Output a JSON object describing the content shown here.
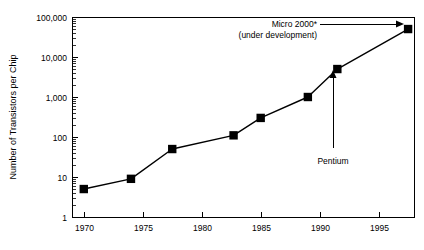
{
  "chart_data": {
    "type": "line",
    "title": "",
    "xlabel": "",
    "ylabel": "Number of Transistors per Chip",
    "xlim": [
      1969.0,
      1998.0
    ],
    "ylim": [
      1,
      100000
    ],
    "yscale": "log",
    "grid": false,
    "legend": "none",
    "xticks": [
      "1970",
      "1975",
      "1980",
      "1985",
      "1990",
      "1995"
    ],
    "xtick_values": [
      1970,
      1975,
      1980,
      1985,
      1990,
      1995
    ],
    "yticks": [
      "1",
      "10",
      "100",
      "1,000",
      "10,000",
      "100,000"
    ],
    "ytick_values": [
      1,
      10,
      100,
      1000,
      10000,
      100000
    ],
    "minor_ticks": true,
    "marker": "square",
    "marker_color": "#000000",
    "line_color": "#000000",
    "x": [
      1970,
      1974,
      1977.5,
      1982.7,
      1985,
      1989,
      1991.5,
      1997.5
    ],
    "values": [
      5,
      9,
      50,
      110,
      300,
      1000,
      5000,
      50000
    ],
    "series": [
      {
        "name": "Transistors per chip",
        "x": [
          1970,
          1974,
          1977.5,
          1982.7,
          1985,
          1989,
          1991.5,
          1997.5
        ],
        "values": [
          5,
          9,
          50,
          110,
          300,
          1000,
          5000,
          50000
        ]
      }
    ],
    "annotations": [
      {
        "name": "micro-2000",
        "lines": [
          "Micro 2000*",
          "(under development)"
        ],
        "points_to_x": 1997.5,
        "points_to_y": 50000,
        "arrow": true
      },
      {
        "name": "pentium",
        "lines": [
          "Pentium"
        ],
        "points_to_x": 1991.5,
        "points_to_y": 5000,
        "arrow": true
      }
    ]
  },
  "axis": {
    "y_title": "Number of Transistors per Chip",
    "y_labels": [
      "100,000",
      "10,000",
      "1,000",
      "100",
      "10",
      "1"
    ],
    "x_labels": [
      "1970",
      "1975",
      "1980",
      "1985",
      "1990",
      "1995"
    ]
  },
  "annotations": {
    "micro_line1": "Micro 2000*",
    "micro_line2": "(under development)",
    "pentium": "Pentium"
  },
  "colors": {
    "background": "#ffffff",
    "ink": "#000000",
    "frame": "#000000"
  }
}
